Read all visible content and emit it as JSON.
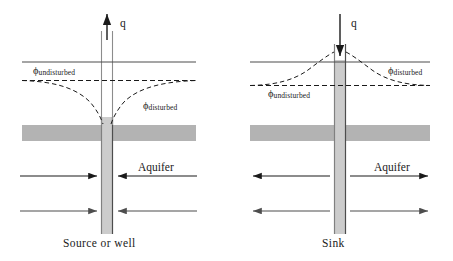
{
  "figure": {
    "colors": {
      "line": "#1a1a1a",
      "aquifer_band": "#b3b3b3",
      "well_fill": "#cccccc",
      "well_edge": "#808080",
      "background": "#ffffff"
    },
    "panels": [
      {
        "id": "left",
        "caption": "Source or well",
        "flux_label": "q",
        "flux_direction": "up",
        "aquifer_label": "Aquifer",
        "flow_direction": "inward",
        "head_labels": [
          {
            "symbol": "ϕ",
            "subscript": "undisturbed"
          },
          {
            "symbol": "ϕ",
            "subscript": "disturbed"
          }
        ]
      },
      {
        "id": "right",
        "caption": "Sink",
        "flux_label": "q",
        "flux_direction": "down",
        "aquifer_label": "Aquifer",
        "flow_direction": "outward",
        "head_labels": [
          {
            "symbol": "ϕ",
            "subscript": "undisturbed"
          },
          {
            "symbol": "ϕ",
            "subscript": "disturbed"
          }
        ]
      }
    ]
  },
  "labels": {
    "left": {
      "q": "q",
      "phi_symbol": "ϕ",
      "undisturbed_sub": "undisturbed",
      "disturbed_sub": "disturbed",
      "aquifer": "Aquifer",
      "caption": "Source or well"
    },
    "right": {
      "q": "q",
      "phi_symbol": "ϕ",
      "undisturbed_sub": "undisturbed",
      "disturbed_sub": "disturbed",
      "aquifer": "Aquifer",
      "caption": "Sink"
    }
  }
}
